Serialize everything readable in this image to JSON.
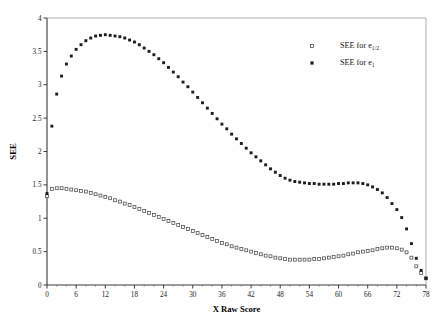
{
  "chart_data": {
    "type": "scatter",
    "title": "",
    "xlabel": "X Raw Score",
    "ylabel": "SEE",
    "xlim": [
      0,
      78
    ],
    "ylim": [
      0,
      4
    ],
    "xticks": [
      0,
      6,
      12,
      18,
      24,
      30,
      36,
      42,
      48,
      54,
      60,
      66,
      72,
      78
    ],
    "yticks": [
      0,
      0.5,
      1,
      1.5,
      2,
      2.5,
      3,
      3.5,
      4
    ],
    "xtick_labels": [
      "0",
      "6",
      "12",
      "18",
      "24",
      "30",
      "36",
      "42",
      "48",
      "54",
      "60",
      "66",
      "72",
      "78"
    ],
    "ytick_labels": [
      "0",
      "0.5",
      "1",
      "1.5",
      "2",
      "2.5",
      "3",
      "3.5",
      "4"
    ],
    "grid": false,
    "legend_position": "top-right",
    "series": [
      {
        "name": "SEE for e_1/2",
        "label": "SEE for e",
        "label_sub": "1/2",
        "marker": "open-square",
        "color": "#4a4a4a",
        "x": [
          0,
          1,
          2,
          3,
          4,
          5,
          6,
          7,
          8,
          9,
          10,
          11,
          12,
          13,
          14,
          15,
          16,
          17,
          18,
          19,
          20,
          21,
          22,
          23,
          24,
          25,
          26,
          27,
          28,
          29,
          30,
          31,
          32,
          33,
          34,
          35,
          36,
          37,
          38,
          39,
          40,
          41,
          42,
          43,
          44,
          45,
          46,
          47,
          48,
          49,
          50,
          51,
          52,
          53,
          54,
          55,
          56,
          57,
          58,
          59,
          60,
          61,
          62,
          63,
          64,
          65,
          66,
          67,
          68,
          69,
          70,
          71,
          72,
          73,
          74,
          75,
          76,
          77,
          78
        ],
        "y": [
          1.33,
          1.44,
          1.45,
          1.45,
          1.44,
          1.43,
          1.42,
          1.41,
          1.4,
          1.38,
          1.36,
          1.34,
          1.32,
          1.3,
          1.27,
          1.25,
          1.22,
          1.2,
          1.17,
          1.14,
          1.11,
          1.08,
          1.05,
          1.02,
          0.99,
          0.96,
          0.93,
          0.9,
          0.87,
          0.84,
          0.81,
          0.78,
          0.75,
          0.72,
          0.69,
          0.66,
          0.63,
          0.61,
          0.58,
          0.56,
          0.54,
          0.52,
          0.5,
          0.48,
          0.46,
          0.44,
          0.43,
          0.41,
          0.4,
          0.39,
          0.38,
          0.38,
          0.38,
          0.38,
          0.38,
          0.39,
          0.39,
          0.4,
          0.41,
          0.42,
          0.43,
          0.44,
          0.46,
          0.47,
          0.49,
          0.5,
          0.51,
          0.52,
          0.54,
          0.55,
          0.56,
          0.56,
          0.55,
          0.53,
          0.49,
          0.41,
          0.28,
          0.18,
          0.1
        ]
      },
      {
        "name": "SEE for e_1",
        "label": "SEE for e",
        "label_sub": "1",
        "marker": "filled-square",
        "color": "#1b1b1b",
        "x": [
          0,
          1,
          2,
          3,
          4,
          5,
          6,
          7,
          8,
          9,
          10,
          11,
          12,
          13,
          14,
          15,
          16,
          17,
          18,
          19,
          20,
          21,
          22,
          23,
          24,
          25,
          26,
          27,
          28,
          29,
          30,
          31,
          32,
          33,
          34,
          35,
          36,
          37,
          38,
          39,
          40,
          41,
          42,
          43,
          44,
          45,
          46,
          47,
          48,
          49,
          50,
          51,
          52,
          53,
          54,
          55,
          56,
          57,
          58,
          59,
          60,
          61,
          62,
          63,
          64,
          65,
          66,
          67,
          68,
          69,
          70,
          71,
          72,
          73,
          74,
          75,
          76,
          77,
          78
        ],
        "y": [
          1.37,
          2.38,
          2.86,
          3.13,
          3.31,
          3.43,
          3.53,
          3.6,
          3.66,
          3.7,
          3.73,
          3.74,
          3.75,
          3.74,
          3.73,
          3.72,
          3.7,
          3.67,
          3.64,
          3.6,
          3.55,
          3.5,
          3.45,
          3.39,
          3.33,
          3.26,
          3.19,
          3.12,
          3.04,
          2.97,
          2.89,
          2.81,
          2.73,
          2.65,
          2.57,
          2.49,
          2.41,
          2.34,
          2.26,
          2.19,
          2.12,
          2.05,
          1.98,
          1.92,
          1.86,
          1.8,
          1.74,
          1.69,
          1.64,
          1.6,
          1.57,
          1.55,
          1.54,
          1.53,
          1.52,
          1.52,
          1.51,
          1.51,
          1.51,
          1.51,
          1.52,
          1.52,
          1.53,
          1.53,
          1.53,
          1.52,
          1.5,
          1.47,
          1.43,
          1.38,
          1.31,
          1.22,
          1.13,
          1.01,
          0.84,
          0.62,
          0.4,
          0.22,
          0.1
        ]
      }
    ]
  },
  "legend": {
    "entries": [
      {
        "label": "SEE for e",
        "subscript": "1/2",
        "marker": "open-square"
      },
      {
        "label": "SEE for e",
        "subscript": "1",
        "marker": "filled-square"
      }
    ]
  }
}
